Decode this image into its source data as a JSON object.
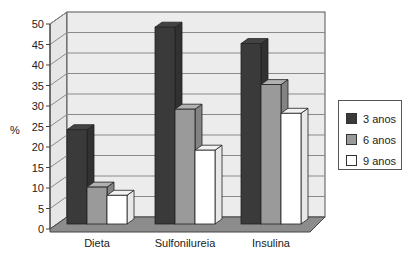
{
  "chart_data": {
    "type": "bar",
    "style": "3d-clustered-column",
    "title": "",
    "xlabel": "",
    "ylabel": "%",
    "ylim": [
      0,
      50
    ],
    "yticks": [
      0,
      5,
      10,
      15,
      20,
      25,
      30,
      35,
      40,
      45,
      50
    ],
    "grid": true,
    "legend_position": "right",
    "categories": [
      "Dieta",
      "Sulfonilureia",
      "Insulina"
    ],
    "series": [
      {
        "name": "3 anos",
        "color": "#3a3a3a",
        "values": [
          23,
          48,
          44
        ]
      },
      {
        "name": "6 anos",
        "color": "#9a9a9a",
        "values": [
          9,
          28,
          34
        ]
      },
      {
        "name": "9 anos",
        "color": "#ffffff",
        "values": [
          7,
          18,
          27
        ]
      }
    ]
  },
  "legend": {
    "items": [
      {
        "label": "3 anos",
        "color": "#3a3a3a"
      },
      {
        "label": "6 anos",
        "color": "#9a9a9a"
      },
      {
        "label": "9 anos",
        "color": "#ffffff"
      }
    ]
  },
  "axis": {
    "ylabel": "%"
  }
}
